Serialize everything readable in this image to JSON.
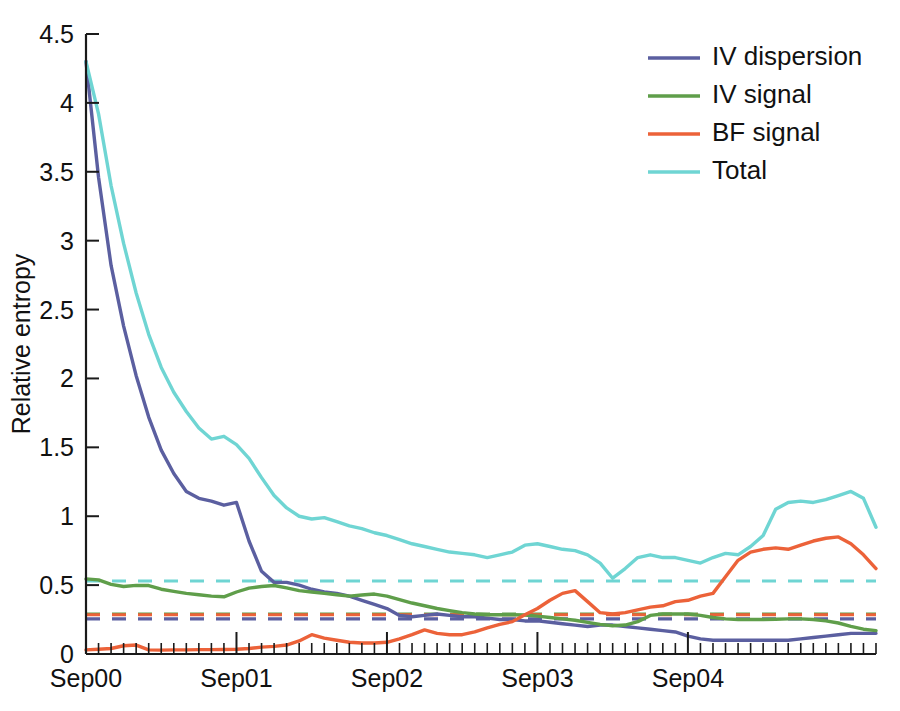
{
  "chart_data": {
    "type": "line",
    "title": "",
    "xlabel": "",
    "ylabel": "Relative entropy",
    "ylim": [
      0,
      4.5
    ],
    "yticks": [
      0,
      0.5,
      1,
      1.5,
      2,
      2.5,
      3,
      3.5,
      4,
      4.5
    ],
    "yticklabels": [
      "0",
      "0.5",
      "1",
      "1.5",
      "2",
      "2.5",
      "3",
      "3.5",
      "4",
      "4.5"
    ],
    "xlim": [
      0,
      63
    ],
    "xticks": [
      0,
      12,
      24,
      36,
      48
    ],
    "xticklabels": [
      "Sep00",
      "Sep01",
      "Sep02",
      "Sep03",
      "Sep04"
    ],
    "minor_tick_interval_months": 1,
    "grid": false,
    "legend_position": "top-right",
    "legend": [
      "IV dispersion",
      "IV signal",
      "BF signal",
      "Total"
    ],
    "colors": {
      "iv_dispersion": "#5b5fa0",
      "iv_signal": "#5f9e4a",
      "bf_signal": "#ec6239",
      "total": "#6fd5d3"
    },
    "x": [
      0,
      1,
      2,
      3,
      4,
      5,
      6,
      7,
      8,
      9,
      10,
      11,
      12,
      13,
      14,
      15,
      16,
      17,
      18,
      19,
      20,
      21,
      22,
      23,
      24,
      25,
      26,
      27,
      28,
      29,
      30,
      31,
      32,
      33,
      34,
      35,
      36,
      37,
      38,
      39,
      40,
      41,
      42,
      43,
      44,
      45,
      46,
      47,
      48,
      49,
      50,
      51,
      52,
      53,
      54,
      55,
      56,
      57,
      58,
      59,
      60,
      61,
      62,
      63
    ],
    "series": [
      {
        "name": "IV dispersion",
        "color": "#5b5fa0",
        "values": [
          4.3,
          3.46,
          2.82,
          2.38,
          2.02,
          1.72,
          1.48,
          1.31,
          1.18,
          1.13,
          1.11,
          1.08,
          1.1,
          0.82,
          0.6,
          0.52,
          0.52,
          0.5,
          0.47,
          0.45,
          0.44,
          0.42,
          0.39,
          0.36,
          0.33,
          0.28,
          0.27,
          0.28,
          0.29,
          0.28,
          0.27,
          0.27,
          0.26,
          0.25,
          0.25,
          0.24,
          0.24,
          0.23,
          0.22,
          0.21,
          0.2,
          0.21,
          0.21,
          0.2,
          0.19,
          0.18,
          0.17,
          0.16,
          0.13,
          0.11,
          0.1,
          0.1,
          0.1,
          0.1,
          0.1,
          0.1,
          0.1,
          0.11,
          0.12,
          0.13,
          0.14,
          0.15,
          0.15,
          0.15
        ]
      },
      {
        "name": "IV signal",
        "color": "#5f9e4a",
        "values": [
          0.545,
          0.538,
          0.505,
          0.49,
          0.498,
          0.497,
          0.47,
          0.455,
          0.44,
          0.43,
          0.42,
          0.415,
          0.45,
          0.478,
          0.49,
          0.497,
          0.48,
          0.46,
          0.45,
          0.44,
          0.43,
          0.42,
          0.428,
          0.435,
          0.42,
          0.395,
          0.37,
          0.35,
          0.33,
          0.315,
          0.3,
          0.29,
          0.285,
          0.285,
          0.285,
          0.283,
          0.275,
          0.265,
          0.255,
          0.245,
          0.23,
          0.215,
          0.205,
          0.21,
          0.235,
          0.28,
          0.29,
          0.29,
          0.29,
          0.28,
          0.265,
          0.255,
          0.25,
          0.25,
          0.25,
          0.252,
          0.255,
          0.255,
          0.25,
          0.24,
          0.225,
          0.2,
          0.18,
          0.17
        ]
      },
      {
        "name": "BF signal",
        "color": "#ec6239",
        "values": [
          0.03,
          0.035,
          0.04,
          0.06,
          0.065,
          0.03,
          0.028,
          0.03,
          0.03,
          0.032,
          0.032,
          0.033,
          0.035,
          0.04,
          0.05,
          0.055,
          0.065,
          0.095,
          0.14,
          0.115,
          0.1,
          0.085,
          0.08,
          0.08,
          0.085,
          0.11,
          0.14,
          0.175,
          0.15,
          0.14,
          0.14,
          0.16,
          0.19,
          0.215,
          0.235,
          0.285,
          0.33,
          0.39,
          0.44,
          0.46,
          0.38,
          0.3,
          0.29,
          0.3,
          0.32,
          0.34,
          0.35,
          0.38,
          0.39,
          0.42,
          0.44,
          0.56,
          0.68,
          0.74,
          0.76,
          0.77,
          0.76,
          0.79,
          0.82,
          0.84,
          0.85,
          0.8,
          0.72,
          0.62
        ]
      },
      {
        "name": "Total",
        "color": "#6fd5d3",
        "values": [
          4.3,
          3.92,
          3.4,
          2.98,
          2.62,
          2.32,
          2.08,
          1.9,
          1.76,
          1.64,
          1.56,
          1.58,
          1.52,
          1.42,
          1.28,
          1.15,
          1.06,
          1.0,
          0.98,
          0.99,
          0.96,
          0.93,
          0.91,
          0.88,
          0.86,
          0.83,
          0.8,
          0.78,
          0.76,
          0.74,
          0.73,
          0.72,
          0.7,
          0.72,
          0.74,
          0.79,
          0.8,
          0.78,
          0.76,
          0.75,
          0.72,
          0.66,
          0.55,
          0.62,
          0.7,
          0.72,
          0.7,
          0.7,
          0.68,
          0.66,
          0.7,
          0.73,
          0.72,
          0.78,
          0.86,
          1.05,
          1.1,
          1.11,
          1.1,
          1.12,
          1.15,
          1.18,
          1.13,
          0.92
        ]
      }
    ],
    "reference_lines": [
      {
        "name": "Total mean",
        "color": "#6fd5d3",
        "value": 0.53
      },
      {
        "name": "IV signal mean",
        "color": "#5f9e4a",
        "value": 0.29
      },
      {
        "name": "BF signal mean",
        "color": "#ec6239",
        "value": 0.285
      },
      {
        "name": "IV dispersion mean",
        "color": "#5b5fa0",
        "value": 0.255
      }
    ]
  }
}
